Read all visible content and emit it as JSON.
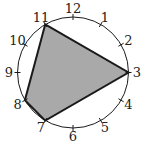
{
  "diagram": {
    "type": "clock-polygon",
    "center": [
      73,
      72.5
    ],
    "radius": 55.5,
    "label_radius": 64,
    "tick_length": 6,
    "colors": {
      "stroke": "#1a1a1a",
      "fill": "#a9a9a9",
      "background": "#ffffff",
      "label": "#222222"
    },
    "hours": [
      "1",
      "2",
      "3",
      "4",
      "5",
      "6",
      "7",
      "8",
      "9",
      "10",
      "11",
      "12"
    ],
    "polygon_vertices": [
      "11",
      "3",
      "7",
      "8"
    ],
    "vertex_labels": {
      "11": "11",
      "3": "3",
      "7": "7",
      "8": "8"
    }
  }
}
